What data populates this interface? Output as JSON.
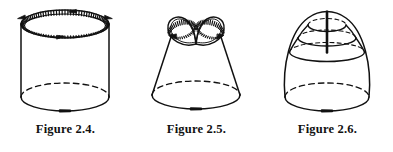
{
  "plate": {
    "background_color": "#ffffff",
    "ink_color": "#111111",
    "figure_count": 3
  },
  "figures": [
    {
      "id": "figure-2-4",
      "caption": "Figure 2.4.",
      "solid": "cylinder",
      "description": "Right circular cylinder with a hatched top boundary circle carrying direction arrows, a dashed hidden rear base arc and a solid front base arc with a direction arrow.",
      "top_curve": {
        "style": "hatched-double-ellipse",
        "arrow_count": 4,
        "arrow_direction": "counterclockwise",
        "hatch_ticks": 96
      },
      "base_curve": {
        "front_style": "solid",
        "back_style": "dashed",
        "arrow_count": 1,
        "arrow_position": "front-center"
      },
      "geometry": {
        "cx": 65,
        "top_cy": 24,
        "base_cy": 97,
        "rx": 44,
        "ry": 14
      }
    },
    {
      "id": "figure-2-5",
      "caption": "Figure 2.5.",
      "solid": "truncated-cone",
      "description": "Truncated cone (frustum) whose upper boundary is a hatched figure-eight (two lobes crossing at a single point) carrying direction arrows; dashed hidden rear base arc and solid front base arc with a direction arrow.",
      "top_curve": {
        "style": "hatched-figure-eight",
        "lobes": 2,
        "crossing_points": 1,
        "arrow_count": 2,
        "hatch_ticks": 80
      },
      "base_curve": {
        "front_style": "solid",
        "back_style": "dashed",
        "arrow_count": 1,
        "arrow_position": "front-center"
      },
      "geometry": {
        "cx": 65,
        "top_cy": 34,
        "base_cy": 95,
        "top_rx": 24,
        "top_ry": 9,
        "base_rx": 44,
        "base_ry": 14
      }
    },
    {
      "id": "figure-2-6",
      "caption": "Figure 2.6.",
      "solid": "dome",
      "description": "Dome or bullet shaped solid sliced by three nested horizontal level ellipses, each dashed at the rear and solid in front, with a heavy vertical segment running down the apex; dashed hidden rear base arc and solid front base arc with a direction arrow.",
      "level_curves": {
        "count": 3,
        "front_style": "solid",
        "back_style": "dashed"
      },
      "apex_segment": {
        "style": "thick-vertical-line",
        "stroke_width": 2.6
      },
      "base_curve": {
        "front_style": "solid",
        "back_style": "dashed",
        "arrow_count": 1,
        "arrow_position": "front-center"
      },
      "geometry": {
        "cx": 65,
        "apex_cy": 13,
        "base_cy": 97,
        "base_rx": 42,
        "base_ry": 14
      }
    }
  ]
}
